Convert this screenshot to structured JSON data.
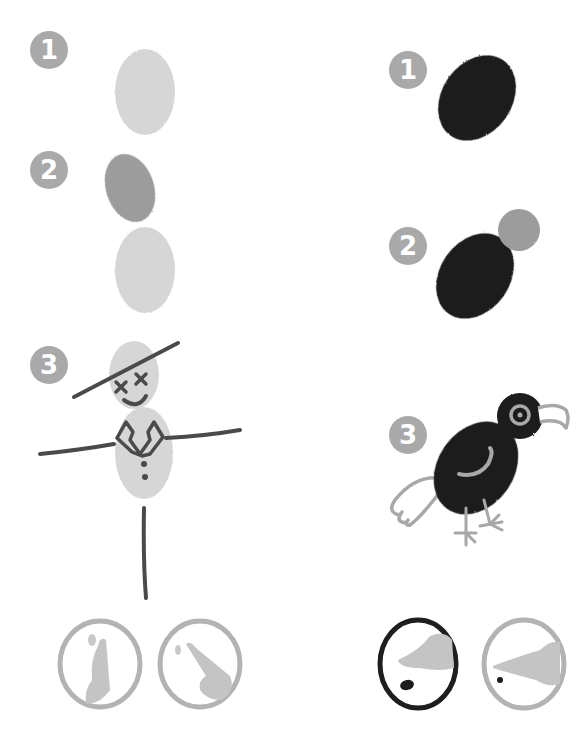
{
  "colors": {
    "background": "#ffffff",
    "badge": "#a9a9a9",
    "light_print": "#d6d6d6",
    "medium_print": "#9c9c9c",
    "dark_print": "#1c1c1c",
    "line_dark": "#4a4a4a",
    "line_light": "#a8a8a8",
    "ring_light": "#b3b3b3",
    "ring_dark": "#1e1e1e",
    "skin": "#c4c4c4"
  },
  "left_column": {
    "subject": "scarecrow",
    "steps": [
      {
        "number": "1",
        "description": "light oval thumbprint"
      },
      {
        "number": "2",
        "description": "darker oval print above light oval"
      },
      {
        "number": "3",
        "description": "scarecrow with hat, cross eyes, smile, collar, buttons, arms and pole"
      }
    ],
    "technique_icons": [
      {
        "name": "thumb-print",
        "ring": "light"
      },
      {
        "name": "fingertip-print",
        "ring": "light"
      }
    ]
  },
  "right_column": {
    "subject": "crow",
    "steps": [
      {
        "number": "1",
        "description": "black oval print"
      },
      {
        "number": "2",
        "description": "grey round print for head"
      },
      {
        "number": "3",
        "description": "crow with eye, beak, wing, tail and legs"
      }
    ],
    "technique_icons": [
      {
        "name": "side-of-finger-print",
        "ring": "dark"
      },
      {
        "name": "fingertip-dot-print",
        "ring": "light"
      }
    ]
  }
}
